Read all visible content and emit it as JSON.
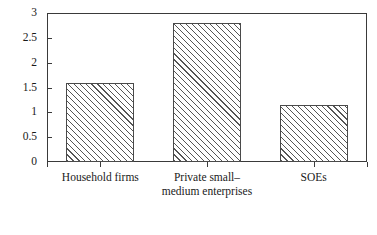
{
  "chart_data": {
    "type": "bar",
    "title": "",
    "subtitle": "",
    "xlabel": "",
    "ylabel": "",
    "categories": [
      "Household firms",
      "Private small–medium enterprises",
      "SOEs"
    ],
    "values": [
      1.6,
      2.8,
      1.15
    ],
    "series": [
      {
        "name": "",
        "values": [
          1.6,
          2.8,
          1.15
        ]
      }
    ],
    "ylim": [
      0,
      3
    ],
    "xlim": [
      0,
      3
    ],
    "y_ticks": [
      0,
      0.5,
      1,
      1.5,
      2,
      2.5,
      3
    ],
    "y_tick_labels": [
      "0",
      "0.5",
      "1",
      "1.5",
      "2",
      "2.5",
      "3"
    ],
    "grid": false,
    "legend": false,
    "legend_position": "none",
    "annotations": [],
    "style": {
      "bar_fill": "#ffffff",
      "bar_hatch": "diagonal-lines",
      "bar_edge_color": "#4a4a4a",
      "hatch_color": "#555555",
      "axis_color": "#3a3a3a",
      "text_color": "#1a1a1a",
      "background": "#ffffff"
    }
  }
}
